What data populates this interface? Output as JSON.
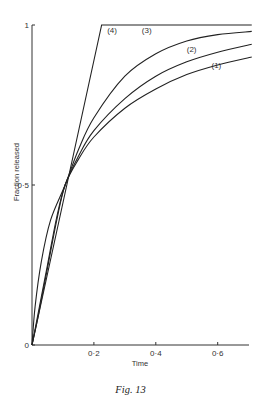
{
  "chart_data": {
    "type": "line",
    "title": "",
    "caption": "Fig. 13",
    "xlabel": "Time",
    "ylabel": "Fraction released",
    "xlim": [
      0,
      0.71
    ],
    "ylim": [
      0,
      1
    ],
    "xticks": [
      {
        "value": 0.2,
        "label": "0·2"
      },
      {
        "value": 0.4,
        "label": "0·4"
      },
      {
        "value": 0.6,
        "label": "0·6"
      }
    ],
    "yticks": [
      {
        "value": 0,
        "label": "0"
      },
      {
        "value": 0.5,
        "label": "0·5"
      },
      {
        "value": 1,
        "label": "1"
      }
    ],
    "grid": false,
    "legend": "inline curve labels",
    "series": [
      {
        "name": "(1)",
        "x": [
          0,
          0.02,
          0.05,
          0.08,
          0.107,
          0.15,
          0.2,
          0.3,
          0.4,
          0.5,
          0.6,
          0.71
        ],
        "y": [
          0,
          0.09,
          0.24,
          0.39,
          0.5,
          0.58,
          0.65,
          0.74,
          0.8,
          0.845,
          0.875,
          0.9
        ]
      },
      {
        "name": "(2)",
        "x": [
          0,
          0.02,
          0.05,
          0.08,
          0.107,
          0.15,
          0.2,
          0.3,
          0.4,
          0.5,
          0.6,
          0.71
        ],
        "y": [
          0,
          0.1,
          0.25,
          0.4,
          0.5,
          0.59,
          0.67,
          0.77,
          0.84,
          0.885,
          0.915,
          0.94
        ]
      },
      {
        "name": "(3)",
        "x": [
          0,
          0.01,
          0.03,
          0.06,
          0.107,
          0.15,
          0.2,
          0.3,
          0.4,
          0.5,
          0.6,
          0.71
        ],
        "y": [
          0,
          0.12,
          0.26,
          0.39,
          0.5,
          0.61,
          0.71,
          0.84,
          0.91,
          0.95,
          0.97,
          0.98
        ]
      },
      {
        "name": "(4)",
        "x": [
          0,
          0.225,
          0.71
        ],
        "y": [
          0,
          1,
          1
        ]
      }
    ],
    "label_positions": [
      {
        "name": "(1)",
        "x": 0.58,
        "y": 0.875
      },
      {
        "name": "(2)",
        "x": 0.5,
        "y": 0.925
      },
      {
        "name": "(3)",
        "x": 0.355,
        "y": 0.985
      },
      {
        "name": "(4)",
        "x": 0.243,
        "y": 0.985
      }
    ],
    "line_color": "#222222"
  },
  "figure": {
    "caption": "Fig. 13"
  }
}
